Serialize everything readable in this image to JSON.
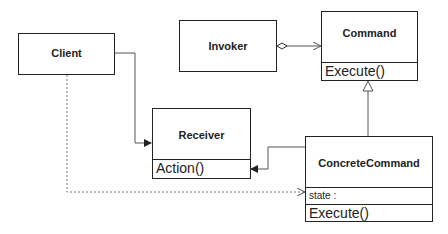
{
  "diagram": {
    "type": "UML class diagram",
    "classes": {
      "client": {
        "name": "Client"
      },
      "invoker": {
        "name": "Invoker"
      },
      "command": {
        "name": "Command",
        "operations": [
          "Execute()"
        ]
      },
      "receiver": {
        "name": "Receiver",
        "operations": [
          "Action()"
        ]
      },
      "concrete_command": {
        "name": "ConcreteCommand",
        "attributes": [
          "state :"
        ],
        "operations": [
          "Execute()"
        ]
      }
    },
    "relationships": [
      {
        "from": "Client",
        "to": "Receiver",
        "kind": "association"
      },
      {
        "from": "Invoker",
        "to": "Command",
        "kind": "aggregation"
      },
      {
        "from": "ConcreteCommand",
        "to": "Command",
        "kind": "generalization"
      },
      {
        "from": "ConcreteCommand",
        "to": "Receiver",
        "kind": "association"
      },
      {
        "from": "Client",
        "to": "ConcreteCommand",
        "kind": "dependency"
      }
    ]
  }
}
